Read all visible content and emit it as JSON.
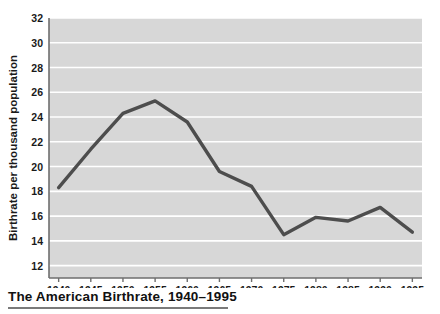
{
  "caption": {
    "text": "The American Birthrate, 1940–1995"
  },
  "colors": {
    "plot_background": "#d7d7d7",
    "gridline": "#ffffff",
    "axis": "#6e6e6e",
    "line": "#4d4d4d",
    "text": "#1a1a1a",
    "caption_rule": "#7a7a7a",
    "page_background": "#ffffff"
  },
  "chart_data": {
    "type": "line",
    "title": "The American Birthrate, 1940–1995",
    "xlabel": "",
    "ylabel": "Birthrate per thousand population",
    "x": [
      1940,
      1945,
      1950,
      1955,
      1960,
      1965,
      1970,
      1975,
      1980,
      1985,
      1990,
      1995
    ],
    "values": [
      18.3,
      21.4,
      24.3,
      25.3,
      23.6,
      19.6,
      18.4,
      14.5,
      15.9,
      15.6,
      16.7,
      14.7
    ],
    "series": [
      {
        "name": "Birthrate per thousand population",
        "values": [
          18.3,
          21.4,
          24.3,
          25.3,
          23.6,
          19.6,
          18.4,
          14.5,
          15.9,
          15.6,
          16.7,
          14.7
        ]
      }
    ],
    "xlim": [
      1938.5,
      1996.5
    ],
    "ylim": [
      11.0,
      32.0
    ],
    "xticks": [
      1940,
      1945,
      1950,
      1955,
      1960,
      1965,
      1970,
      1975,
      1980,
      1985,
      1990,
      1995
    ],
    "xticklabels": [
      "1940",
      "1945",
      "1950",
      "1955",
      "1960",
      "1965",
      "1970",
      "1975",
      "1980",
      "1985",
      "1990",
      "1995"
    ],
    "yticks": [
      12,
      14,
      16,
      18,
      20,
      22,
      24,
      26,
      28,
      30,
      32
    ],
    "yticklabels": [
      "12",
      "14",
      "16",
      "18",
      "20",
      "22",
      "24",
      "26",
      "28",
      "30",
      "32"
    ],
    "grid": "horizontal",
    "legend": "none"
  }
}
